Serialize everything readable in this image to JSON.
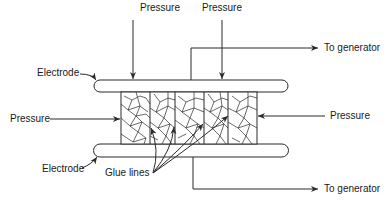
{
  "labels": {
    "pressure_top_left": "Pressure",
    "pressure_top_right": "Pressure",
    "pressure_left": "Pressure",
    "pressure_right": "Pressure",
    "electrode_top": "Electrode",
    "electrode_bottom": "Electrode",
    "generator_top": "To generator",
    "generator_bottom": "To generator",
    "glue_lines": "Glue lines"
  },
  "colors": {
    "stroke": "#2a2a2a",
    "background": "#ffffff"
  },
  "components": {
    "electrodes": 2,
    "laminate_sections": 5,
    "glue_line_pointers": 4,
    "pressure_arrows": 4,
    "generator_leads": 2
  }
}
